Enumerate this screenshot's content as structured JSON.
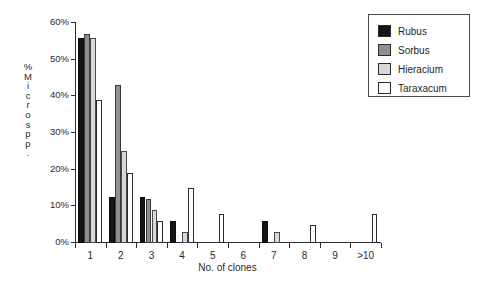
{
  "chart_data": {
    "type": "bar",
    "title": "",
    "xlabel": "No. of clones",
    "ylabel": "% Micros pp.",
    "ylabel_vertical_chars": "%\nM\ni\nc\nr\no\ns\np\np\n.",
    "categories": [
      "1",
      "2",
      "3",
      "4",
      "5",
      "6",
      "7",
      "8",
      "9",
      ">10"
    ],
    "ylim": [
      0,
      60
    ],
    "ytick_labels": [
      "0%",
      "10%",
      "20%",
      "30%",
      "40%",
      "50%",
      "60%"
    ],
    "ytick_values": [
      0,
      10,
      20,
      30,
      40,
      50,
      60
    ],
    "grid": false,
    "legend_position": "top-right",
    "series": [
      {
        "name": "Rubus",
        "color": "#151515",
        "values": [
          56,
          12.5,
          12.5,
          6,
          0,
          0,
          6,
          0,
          0,
          0
        ]
      },
      {
        "name": "Sorbus",
        "color": "#8f8f8f",
        "values": [
          57,
          43,
          12,
          0,
          0,
          0,
          0,
          0,
          0,
          0
        ]
      },
      {
        "name": "Hieracium",
        "color": "#d8d8d8",
        "values": [
          56,
          25,
          9,
          3,
          0,
          0,
          3,
          0,
          0,
          0
        ]
      },
      {
        "name": "Taraxacum",
        "color": "#ffffff",
        "values": [
          39,
          19,
          6,
          15,
          8,
          0,
          0,
          5,
          0,
          8
        ]
      }
    ]
  }
}
